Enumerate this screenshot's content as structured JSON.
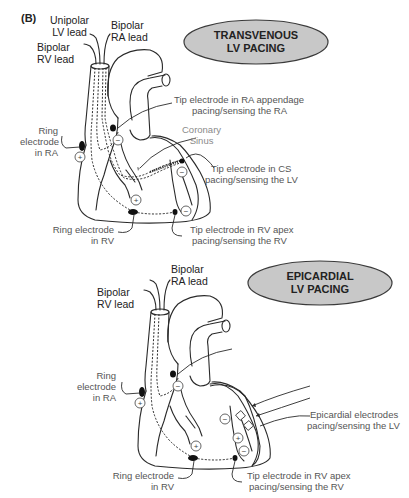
{
  "figure": {
    "panel_label": "(B)",
    "colors": {
      "oval_fill": "#c8c8c8",
      "oval_stroke": "#3a3a3a",
      "line": "#2a2a2a",
      "label_text": "#333333",
      "coronary_sinus_text": "#8a8a8a"
    }
  },
  "transvenous": {
    "title_line1": "TRANSVENOUS",
    "title_line2": "LV PACING",
    "leads": {
      "unipolar_lv_1": "Unipolar",
      "unipolar_lv_2": "LV lead",
      "bipolar_ra_1": "Bipolar",
      "bipolar_ra_2": "RA lead",
      "bipolar_rv_1": "Bipolar",
      "bipolar_rv_2": "RV lead"
    },
    "labels": {
      "ring_ra_1": "Ring",
      "ring_ra_2": "electrode",
      "ring_ra_3": "in RA",
      "tip_ra_1": "Tip electrode in RA appendage",
      "tip_ra_2": "pacing/sensing the RA",
      "cs_1": "Coronary",
      "cs_2": "Sinus",
      "tip_cs_1": "Tip electrode in CS",
      "tip_cs_2": "pacing/sensing the LV",
      "ring_rv_1": "Ring electrode",
      "ring_rv_2": "in RV",
      "tip_rv_1": "Tip electrode in RV apex",
      "tip_rv_2": "pacing/sensing the RV"
    },
    "polarity": {
      "plus": "+",
      "minus": "−"
    }
  },
  "epicardial": {
    "title_line1": "EPICARDIAL",
    "title_line2": "LV PACING",
    "leads": {
      "bipolar_ra_1": "Bipolar",
      "bipolar_ra_2": "RA lead",
      "bipolar_rv_1": "Bipolar",
      "bipolar_rv_2": "RV lead"
    },
    "labels": {
      "ring_ra_1": "Ring",
      "ring_ra_2": "electrode",
      "ring_ra_3": "in RA",
      "epi_1": "Epicardial electrodes",
      "epi_2": "pacing/sensing the LV",
      "ring_rv_1": "Ring electrode",
      "ring_rv_2": "in RV",
      "tip_rv_1": "Tip electrode in RV apex",
      "tip_rv_2": "pacing/sensing the RV"
    },
    "polarity": {
      "plus": "+",
      "minus": "−"
    }
  }
}
